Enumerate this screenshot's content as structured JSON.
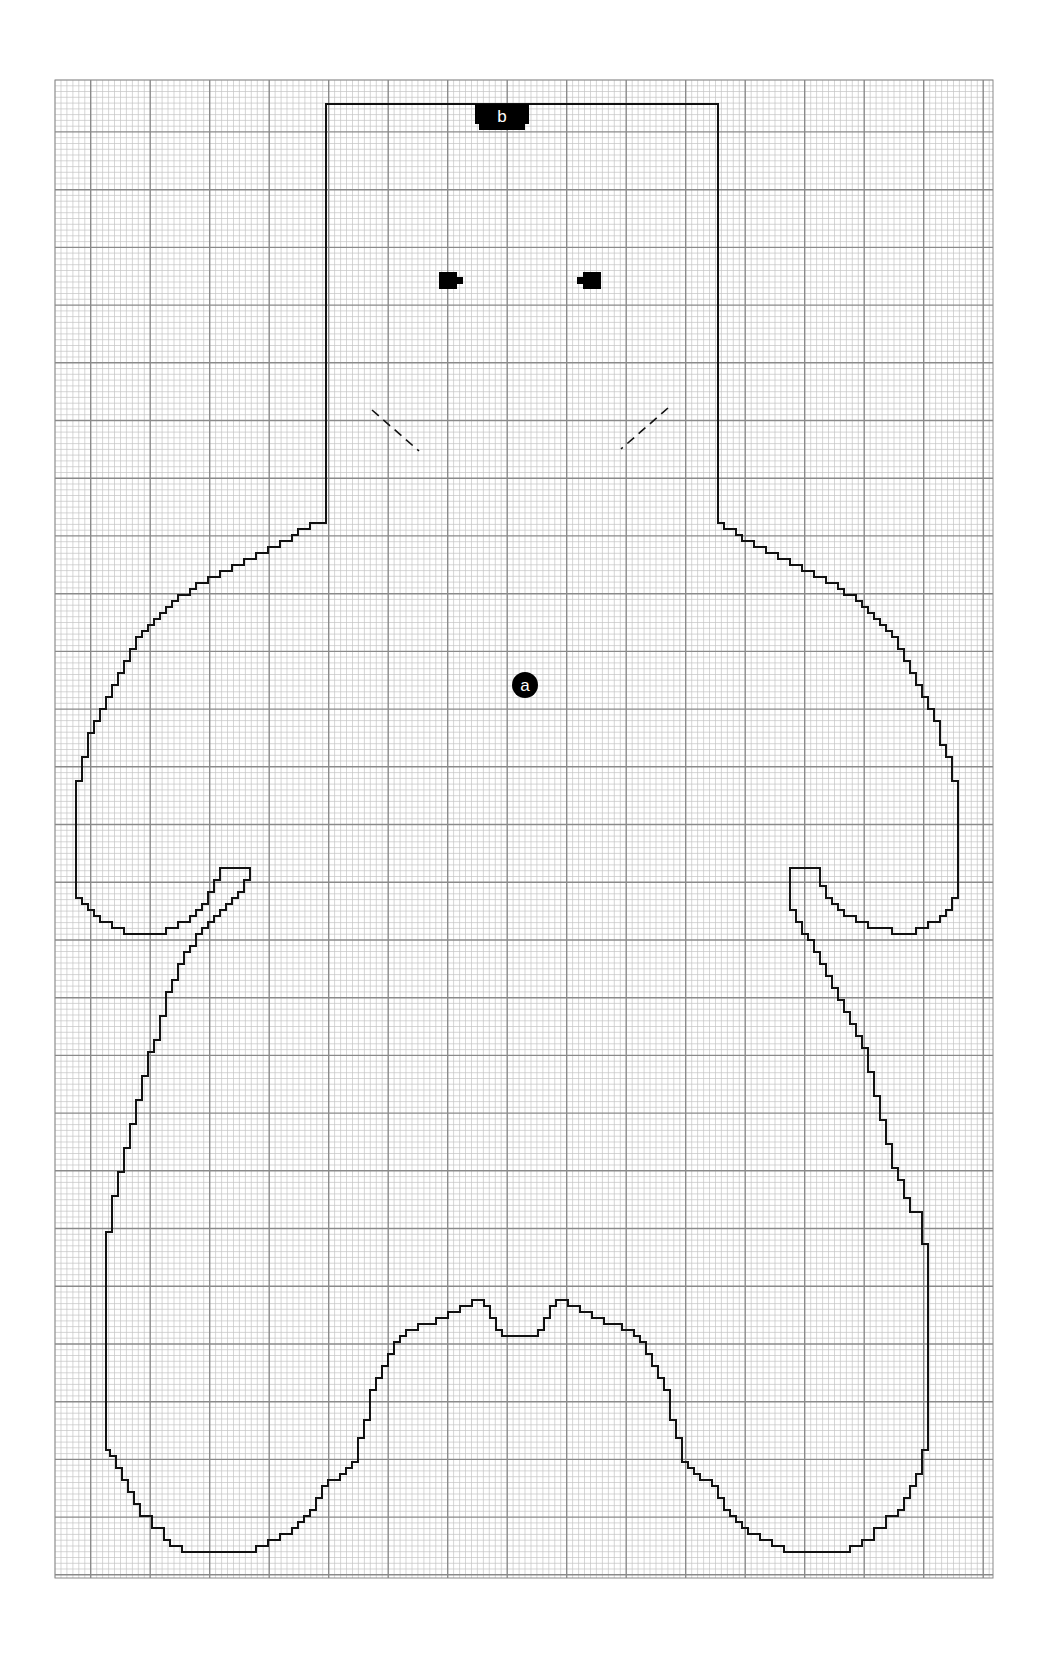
{
  "diagram": {
    "type": "knitting-chart-grid",
    "colors": {
      "grid_minor": "#c4c4c4",
      "grid_major": "#8a8a8a",
      "outline": "#111111",
      "marker": "#000000",
      "marker_text": "#ffffff",
      "background": "#ffffff"
    },
    "grid": {
      "left": 55,
      "top": 80,
      "right": 993,
      "bottom": 1578,
      "minor_step": 5.95,
      "major_every": 10
    },
    "markers": [
      {
        "id": "b",
        "label": "b",
        "shape": "tab",
        "x": 502,
        "y": 117
      },
      {
        "id": "a",
        "label": "a",
        "shape": "circle",
        "x": 525,
        "y": 685
      }
    ],
    "eyes": [
      {
        "name": "left-eye",
        "x": 439,
        "y": 272,
        "w": 18,
        "h": 17
      },
      {
        "name": "right-eye",
        "x": 583,
        "y": 272,
        "w": 18,
        "h": 17
      }
    ],
    "dashed_guides": [
      {
        "name": "left-dashed-guide",
        "x1": 372,
        "y1": 410,
        "x2": 419,
        "y2": 451
      },
      {
        "name": "right-dashed-guide",
        "x1": 668,
        "y1": 408,
        "x2": 621,
        "y2": 449
      }
    ]
  }
}
